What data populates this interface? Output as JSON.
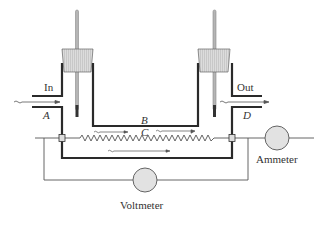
{
  "diagram": {
    "type": "continuous-flow calorimeter apparatus",
    "labels": {
      "inlet": "In",
      "outlet": "Out",
      "point_a": "A",
      "point_b": "B",
      "point_c": "C",
      "point_d": "D",
      "voltmeter": "Voltmeter",
      "ammeter": "Ammeter"
    },
    "components": [
      {
        "name": "inlet-thermometer",
        "kind": "thermometer"
      },
      {
        "name": "outlet-thermometer",
        "kind": "thermometer"
      },
      {
        "name": "flow-tube",
        "kind": "glass tube"
      },
      {
        "name": "heating-coil",
        "kind": "resistance wire",
        "label": "C"
      },
      {
        "name": "voltmeter",
        "kind": "meter"
      },
      {
        "name": "ammeter",
        "kind": "meter"
      }
    ],
    "colors": {
      "wall": "#2a2a2a",
      "wire": "#555555",
      "stopper": "#d8d8d8",
      "meter_fill": "#e2e2e2",
      "thermometer": "#9a9a9a"
    }
  }
}
